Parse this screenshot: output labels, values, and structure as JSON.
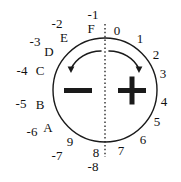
{
  "diagram": {
    "circle": {
      "cx": 105,
      "cy": 90,
      "r": 52,
      "stroke": "#1a1a1a"
    },
    "divider": {
      "name": "vertical-dotted-divider",
      "x": 105,
      "y1": 24,
      "y2": 157,
      "style": "dotted"
    },
    "minus_sign": {
      "label": "−",
      "x": 78,
      "y": 91
    },
    "plus_sign": {
      "label": "+",
      "x": 132,
      "y": 91
    },
    "arrows": [
      {
        "name": "counterclockwise-arrow-left",
        "direction": "left"
      },
      {
        "name": "clockwise-arrow-right",
        "direction": "right"
      }
    ],
    "hex_labels": [
      {
        "text": "0",
        "x": 117,
        "y": 30
      },
      {
        "text": "1",
        "x": 140,
        "y": 38
      },
      {
        "text": "2",
        "x": 156,
        "y": 54
      },
      {
        "text": "3",
        "x": 163,
        "y": 73
      },
      {
        "text": "4",
        "x": 164,
        "y": 101
      },
      {
        "text": "5",
        "x": 157,
        "y": 121
      },
      {
        "text": "6",
        "x": 143,
        "y": 139
      },
      {
        "text": "7",
        "x": 121,
        "y": 150
      },
      {
        "text": "8",
        "x": 96,
        "y": 152
      },
      {
        "text": "9",
        "x": 70,
        "y": 141
      },
      {
        "text": "A",
        "x": 48,
        "y": 127
      },
      {
        "text": "B",
        "x": 40,
        "y": 104
      },
      {
        "text": "C",
        "x": 40,
        "y": 70
      },
      {
        "text": "D",
        "x": 49,
        "y": 51
      },
      {
        "text": "E",
        "x": 64,
        "y": 37
      },
      {
        "text": "F",
        "x": 91,
        "y": 28
      }
    ],
    "dec_labels": [
      {
        "text": "0",
        "x": 117,
        "y": 30
      },
      {
        "text": "-1",
        "x": 93,
        "y": 14
      },
      {
        "text": "-2",
        "x": 57,
        "y": 23
      },
      {
        "text": "-3",
        "x": 35,
        "y": 41
      },
      {
        "text": "-4",
        "x": 22,
        "y": 70
      },
      {
        "text": "-5",
        "x": 21,
        "y": 103
      },
      {
        "text": "-6",
        "x": 32,
        "y": 131
      },
      {
        "text": "-7",
        "x": 57,
        "y": 155
      },
      {
        "text": "-8",
        "x": 93,
        "y": 166
      }
    ]
  }
}
